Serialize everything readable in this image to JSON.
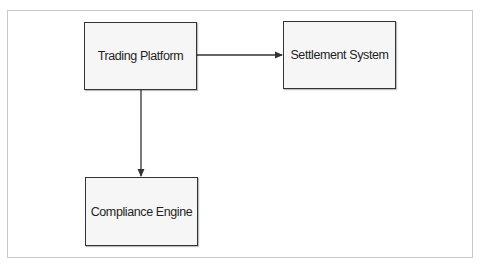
{
  "diagram": {
    "type": "flowchart",
    "nodes": [
      {
        "id": "trading",
        "label": "Trading Platform"
      },
      {
        "id": "settlement",
        "label": "Settlement System"
      },
      {
        "id": "compliance",
        "label": "Compliance Engine"
      }
    ],
    "edges": [
      {
        "from": "trading",
        "to": "settlement",
        "direction": "right"
      },
      {
        "from": "trading",
        "to": "compliance",
        "direction": "down"
      }
    ]
  },
  "colors": {
    "node_fill": "#f6f6f6",
    "node_border": "#333333",
    "edge": "#333333",
    "frame_border": "#c8c8c8"
  }
}
